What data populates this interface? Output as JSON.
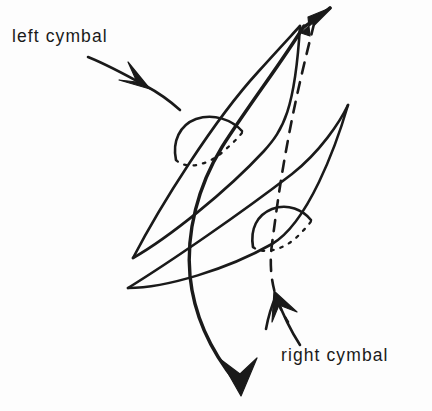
{
  "figure": {
    "background_color": "#fdfdfd",
    "ink_color": "#1a1a1a",
    "width": 432,
    "height": 411
  },
  "labels": {
    "left": "left cymbal",
    "right": "right cymbal"
  },
  "icons": {
    "left_leader": "leader-arrow-icon",
    "right_leader": "leader-arrow-icon",
    "top_arrowhead": "arrowhead-up-right-icon",
    "bottom_arrowhead": "arrowhead-down-icon"
  },
  "elements": {
    "left_cymbal_disc": "elongated-ellipse",
    "right_cymbal_disc": "elongated-ellipse",
    "left_cymbal_bell": "dome",
    "right_cymbal_bell": "dome",
    "left_motion_path": "solid-curve",
    "right_motion_path": "dashed-curve"
  }
}
